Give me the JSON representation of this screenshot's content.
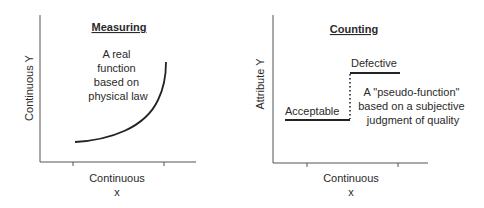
{
  "left_panel": {
    "title": "Measuring",
    "y_axis_label": "Continuous Y",
    "x_axis_label_line1": "Continuous",
    "x_axis_label_line2": "x",
    "annotation": [
      "A real",
      "function",
      "based on",
      "physical law"
    ],
    "curve_description": "increasing convex curve"
  },
  "right_panel": {
    "title": "Counting",
    "y_axis_label": "Attribute Y",
    "x_axis_label_line1": "Continuous",
    "x_axis_label_line2": "x",
    "low_level_label": "Acceptable",
    "high_level_label": "Defective",
    "annotation": [
      "A \"pseudo-function\"",
      "based on a subjective",
      "judgment of quality"
    ],
    "curve_description": "step function with dotted vertical transition"
  },
  "colors": {
    "line": "#222222",
    "axis": "#555555",
    "text": "#2a2a2a",
    "background": "#ffffff"
  }
}
